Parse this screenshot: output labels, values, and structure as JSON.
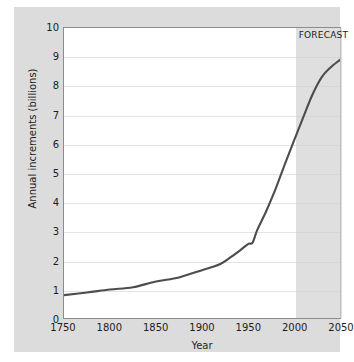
{
  "chart_data": {
    "type": "line",
    "title": "",
    "xlabel": "Year",
    "ylabel": "Annual increments (billions)",
    "xlim": [
      1750,
      2050
    ],
    "ylim": [
      0,
      10
    ],
    "grid": true,
    "legend": null,
    "xticks": [
      "1750",
      "1800",
      "1850",
      "1900",
      "1950",
      "2000",
      "2050"
    ],
    "yticks": [
      "0",
      "1",
      "2",
      "3",
      "4",
      "5",
      "6",
      "7",
      "8",
      "9",
      "10"
    ],
    "annotations": [
      {
        "text": "FORECAST",
        "x_start": 2000,
        "x_end": 2050,
        "shaded": true
      }
    ],
    "series": [
      {
        "name": "World population",
        "color": "#4d4d4d",
        "x": [
          1750,
          1775,
          1800,
          1825,
          1850,
          1875,
          1900,
          1910,
          1920,
          1930,
          1940,
          1950,
          1955,
          1960,
          1970,
          1980,
          1990,
          2000,
          2010,
          2020,
          2030,
          2040,
          2050
        ],
        "values": [
          0.79,
          0.88,
          0.98,
          1.06,
          1.26,
          1.4,
          1.65,
          1.75,
          1.86,
          2.07,
          2.3,
          2.55,
          2.6,
          3.03,
          3.7,
          4.45,
          5.3,
          6.12,
          6.92,
          7.7,
          8.3,
          8.65,
          8.9
        ]
      }
    ]
  },
  "axes": {
    "x_title": "Year",
    "y_title": "Annual increments (billions)",
    "x_tick_labels": [
      "1750",
      "1800",
      "1850",
      "1900",
      "1950",
      "2000",
      "2050"
    ],
    "y_tick_labels": [
      "10",
      "9",
      "8",
      "7",
      "6",
      "5",
      "4",
      "3",
      "2",
      "1",
      "0"
    ]
  },
  "forecast": {
    "label": "FORECAST",
    "start_year": 2000,
    "end_year": 2050
  },
  "colors": {
    "card_background": "#dcdcdc",
    "plot_background": "#ffffff",
    "gridline": "#e3e3e3",
    "plot_border": "#8c8c8c",
    "line": "#4d4d4d",
    "forecast_band": "#d2d2d2",
    "text": "#1d1d1d"
  }
}
